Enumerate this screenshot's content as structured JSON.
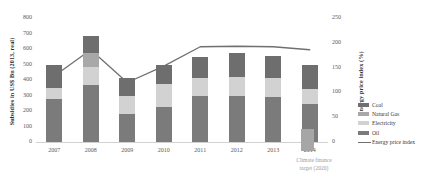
{
  "chart_data": {
    "type": "bar",
    "title": "",
    "subtitle": "",
    "xlabel": "",
    "ylabel": "Subsidies in US$ Bn (2013, real)",
    "y2label": "Energy price index (%)",
    "categories": [
      "2007",
      "2008",
      "2009",
      "2010",
      "2011",
      "2012",
      "2013",
      "2014"
    ],
    "ylim": [
      0,
      800
    ],
    "y2lim": [
      0,
      250
    ],
    "yticks": [
      "0",
      "100",
      "200",
      "300",
      "400",
      "500",
      "600",
      "700",
      "800"
    ],
    "y2ticks": [
      "0",
      "50",
      "100",
      "150",
      "200",
      "250"
    ],
    "grid": false,
    "legend_position": "right",
    "stacked": true,
    "series": [
      {
        "name": "Oil",
        "color": "#7b7b7b",
        "values": [
          278,
          368,
          178,
          225,
          295,
          300,
          292,
          245
        ]
      },
      {
        "name": "Electricity",
        "color": "#d2d2d2",
        "values": [
          70,
          118,
          122,
          150,
          120,
          120,
          120,
          95
        ]
      },
      {
        "name": "Natural Gas",
        "color": "#a8a8a8",
        "values": [
          0,
          90,
          0,
          0,
          0,
          0,
          0,
          0
        ]
      },
      {
        "name": "Coal",
        "color": "#6e6e6e",
        "values": [
          150,
          108,
          113,
          120,
          133,
          152,
          142,
          155
        ]
      }
    ],
    "line_series": {
      "name": "Energy price index",
      "color": "#707070",
      "axis": "right",
      "values": [
        133,
        186,
        120,
        153,
        192,
        193,
        192,
        186
      ]
    },
    "annotation": {
      "label_line1": "Climate finance",
      "label_line2": "target (2020)",
      "value": 100,
      "color": "#a6a6a6"
    }
  },
  "legend": {
    "items": [
      {
        "label": "Coal",
        "marker": "swatch"
      },
      {
        "label": "Natural Gas",
        "marker": "swatch"
      },
      {
        "label": "Electricity",
        "marker": "swatch"
      },
      {
        "label": "Oil",
        "marker": "swatch"
      },
      {
        "label": "Energy price index",
        "marker": "line"
      }
    ]
  }
}
